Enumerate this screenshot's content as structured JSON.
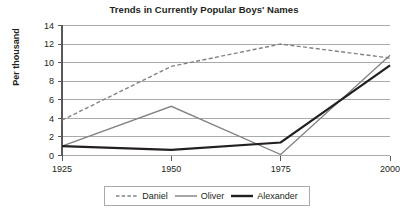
{
  "chart_data": {
    "type": "line",
    "title": "Trends in Currently Popular Boys' Names",
    "xlabel": "",
    "ylabel": "Per thousand",
    "x": [
      1925,
      1950,
      1975,
      2000
    ],
    "xtick_labels": [
      "1925",
      "1950",
      "1975",
      "2000"
    ],
    "ytick_labels": [
      "0",
      "2",
      "4",
      "6",
      "8",
      "10",
      "12",
      "14"
    ],
    "yticks": [
      0,
      2,
      4,
      6,
      8,
      10,
      12,
      14
    ],
    "ylim": [
      0,
      14
    ],
    "grid": "horizontal",
    "legend_position": "bottom",
    "series": [
      {
        "name": "Daniel",
        "values": [
          3.8,
          9.6,
          12.0,
          10.5
        ],
        "style": "dashed",
        "color": "#808285",
        "width": 1.4
      },
      {
        "name": "Oliver",
        "values": [
          1.0,
          5.3,
          0.1,
          10.8
        ],
        "style": "solid",
        "color": "#808285",
        "width": 1.3
      },
      {
        "name": "Alexander",
        "values": [
          1.0,
          0.6,
          1.4,
          9.7
        ],
        "style": "solid",
        "color": "#231f20",
        "width": 2.2
      }
    ]
  },
  "legend": {
    "items": [
      {
        "label": "Daniel"
      },
      {
        "label": "Oliver"
      },
      {
        "label": "Alexander"
      }
    ]
  },
  "axis": {
    "y_title": "Per thousand"
  }
}
